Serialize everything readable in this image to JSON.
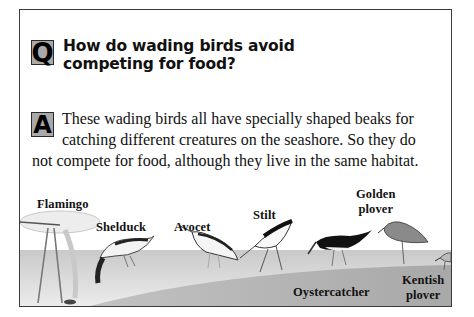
{
  "question": {
    "badge": "Q",
    "text": "How do wading birds avoid competing for food?",
    "line1": "How do wading birds avoid",
    "line2": "competing for food?"
  },
  "answer": {
    "badge": "A",
    "text": "These wading birds all have specially shaped beaks for catching different creatures on the seashore. So they do not compete for food, although they live in the same habitat.",
    "line1": "These wading birds all have specially shaped beaks for",
    "line2": "catching different creatures on the seashore. So they do",
    "line3": "not compete for food, although they live in the same habitat."
  },
  "birds": [
    {
      "name": "Flamingo",
      "line1": "Flamingo",
      "line2": ""
    },
    {
      "name": "Shelduck",
      "line1": "Shelduck",
      "line2": ""
    },
    {
      "name": "Avocet",
      "line1": "Avocet",
      "line2": ""
    },
    {
      "name": "Stilt",
      "line1": "Stilt",
      "line2": ""
    },
    {
      "name": "Oystercatcher",
      "line1": "Oystercatcher",
      "line2": ""
    },
    {
      "name": "Golden plover",
      "line1": "Golden",
      "line2": "plover"
    },
    {
      "name": "Kentish plover",
      "line1": "Kentish",
      "line2": "plover"
    }
  ],
  "colors": {
    "border": "#3a3a3a",
    "badge_fill": "#a9a9a9",
    "water": "#d9d9d9",
    "sand": "#b0b0b0"
  }
}
